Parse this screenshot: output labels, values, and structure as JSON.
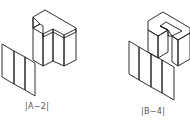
{
  "figures": [
    {
      "id": "A-2",
      "label": "|A−2|",
      "description": "Isometric T-shaped block with notch, and its projection panel divided into 3 vertical strips",
      "projection_strips": 3
    },
    {
      "id": "B-4",
      "label": "|B−4|",
      "description": "Isometric C/U-shaped block, and its projection panel divided into 4 vertical strips",
      "projection_strips": 4
    }
  ],
  "colors": {
    "top_face": "#ffffff",
    "light_face": "#e6e6e6",
    "mid_face": "#cfcfcf",
    "dark_face": "#bdbdbd",
    "edge": "#1a1a1a",
    "label_text": "#555555"
  }
}
